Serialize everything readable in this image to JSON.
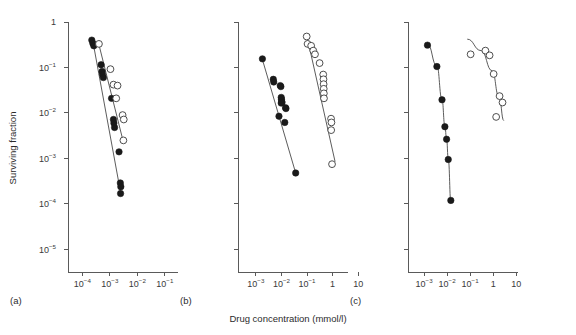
{
  "figure": {
    "width": 576,
    "height": 335,
    "background": "#ffffff",
    "xlabel": "Drug concentration (mmol/l)",
    "ylabel": "Surviving fraction",
    "line_color": "#4a4a4a",
    "axis_color": "#5a5a5a",
    "filled_marker_color": "#1a1a1a",
    "open_marker_color": "#ffffff"
  },
  "y_axis": {
    "label": "Surviving fraction",
    "type": "log",
    "ticks": [
      {
        "label": "1",
        "base": "1",
        "exp": "",
        "value": 1
      },
      {
        "label": "10-1",
        "base": "10",
        "exp": "−1",
        "value": 0.1
      },
      {
        "label": "10-2",
        "base": "10",
        "exp": "−2",
        "value": 0.01
      },
      {
        "label": "10-3",
        "base": "10",
        "exp": "−3",
        "value": 0.001
      },
      {
        "label": "10-4",
        "base": "10",
        "exp": "−4",
        "value": 0.0001
      },
      {
        "label": "10-5",
        "base": "10",
        "exp": "−5",
        "value": 1e-05
      }
    ],
    "range": [
      3.2e-06,
      1
    ]
  },
  "chart_data": [
    {
      "id": "panel-a",
      "type": "scatter",
      "panel_label": "(a)",
      "title": "",
      "xlabel": "Drug concentration (mmol/l)",
      "ylabel": "Surviving fraction",
      "xscale": "log",
      "yscale": "log",
      "xlim": [
        3e-05,
        0.3
      ],
      "ylim": [
        3.2e-06,
        1
      ],
      "grid": false,
      "legend": "none",
      "xticks": [
        {
          "base": "10",
          "exp": "−4",
          "value": 0.0001
        },
        {
          "base": "10",
          "exp": "−3",
          "value": 0.001
        },
        {
          "base": "10",
          "exp": "−2",
          "value": 0.01
        },
        {
          "base": "10",
          "exp": "−1",
          "value": 0.1
        }
      ],
      "series": [
        {
          "name": "filled-circles",
          "marker": "filled-circle",
          "x": [
            0.00022,
            0.00024,
            0.00026,
            0.00048,
            0.00052,
            0.00054,
            0.00058,
            0.00115,
            0.00135,
            0.0014,
            0.00148,
            0.00215,
            0.0024,
            0.0025,
            0.00245
          ],
          "y": [
            0.4,
            0.34,
            0.3,
            0.115,
            0.082,
            0.07,
            0.06,
            0.021,
            0.0072,
            0.006,
            0.0048,
            0.0014,
            0.00029,
            0.00024,
            0.00017
          ],
          "fit_line": {
            "x": [
              0.00024,
              0.00245
            ],
            "y": [
              0.38,
              0.00018
            ]
          }
        },
        {
          "name": "open-circles",
          "marker": "open-circle",
          "x": [
            0.0004,
            0.00105,
            0.00135,
            0.0019,
            0.0017,
            0.0029,
            0.0032,
            0.0031
          ],
          "y": [
            0.33,
            0.092,
            0.042,
            0.04,
            0.021,
            0.009,
            0.0072,
            0.0025
          ],
          "fit_line": {
            "x": [
              0.00038,
              0.00315
            ],
            "y": [
              0.36,
              0.0022
            ]
          }
        }
      ]
    },
    {
      "id": "panel-b",
      "type": "scatter",
      "panel_label": "(b)",
      "title": "",
      "xlabel": "Drug concentration (mmol/l)",
      "ylabel": "Surviving fraction",
      "xscale": "log",
      "yscale": "log",
      "xlim": [
        0.0002,
        4
      ],
      "ylim": [
        3.2e-06,
        1
      ],
      "grid": false,
      "legend": "none",
      "xticks": [
        {
          "base": "10",
          "exp": "−3",
          "value": 0.001
        },
        {
          "base": "10",
          "exp": "−2",
          "value": 0.01
        },
        {
          "base": "10",
          "exp": "−1",
          "value": 0.1
        },
        {
          "base": "1",
          "exp": "",
          "value": 1
        },
        {
          "base": "10",
          "exp": "",
          "value": 10
        }
      ],
      "series": [
        {
          "name": "filled-circles",
          "marker": "filled-circle",
          "x": [
            0.0018,
            0.0048,
            0.005,
            0.009,
            0.0095,
            0.0098,
            0.01,
            0.0102,
            0.0105,
            0.0098,
            0.0145,
            0.015,
            0.008,
            0.0135,
            0.036
          ],
          "y": [
            0.155,
            0.055,
            0.048,
            0.04,
            0.038,
            0.022,
            0.02,
            0.018,
            0.017,
            0.0165,
            0.013,
            0.0125,
            0.0085,
            0.0062,
            0.00048
          ],
          "fit_line": {
            "x": [
              0.0018,
              0.036
            ],
            "y": [
              0.15,
              0.00048
            ]
          }
        },
        {
          "name": "open-circles",
          "marker": "open-circle",
          "x": [
            0.097,
            0.105,
            0.145,
            0.175,
            0.205,
            0.31,
            0.43,
            0.44,
            0.445,
            0.45,
            0.455,
            0.46,
            0.87,
            0.9,
            0.88,
            0.95
          ],
          "y": [
            0.48,
            0.33,
            0.3,
            0.235,
            0.195,
            0.125,
            0.07,
            0.055,
            0.043,
            0.034,
            0.027,
            0.021,
            0.0075,
            0.0062,
            0.0042,
            0.00075
          ],
          "fit_line": {
            "x": [
              0.098,
              1.25
            ],
            "y": [
              0.5,
              0.00085
            ]
          }
        }
      ]
    },
    {
      "id": "panel-c",
      "type": "scatter",
      "panel_label": "(c)",
      "title": "",
      "xlabel": "Drug concentration (mmol/l)",
      "ylabel": "Surviving fraction",
      "xscale": "log",
      "yscale": "log",
      "xlim": [
        0.0002,
        12
      ],
      "ylim": [
        3.2e-06,
        1
      ],
      "grid": false,
      "legend": "none",
      "xticks": [
        {
          "base": "10",
          "exp": "−3",
          "value": 0.001
        },
        {
          "base": "10",
          "exp": "−2",
          "value": 0.01
        },
        {
          "base": "10",
          "exp": "−1",
          "value": 0.1
        },
        {
          "base": "1",
          "exp": "",
          "value": 1
        },
        {
          "base": "10",
          "exp": "",
          "value": 10
        }
      ],
      "series": [
        {
          "name": "filled-circles",
          "marker": "filled-circle",
          "x": [
            0.0014,
            0.0036,
            0.006,
            0.008,
            0.0095,
            0.0112,
            0.0145
          ],
          "y": [
            0.31,
            0.105,
            0.0195,
            0.005,
            0.00265,
            0.00095,
            0.00012
          ],
          "fit_curve": {
            "x": [
              0.0014,
              0.0036,
              0.006,
              0.008,
              0.0095,
              0.0112,
              0.0148
            ],
            "y": [
              0.33,
              0.108,
              0.02,
              0.0052,
              0.0027,
              0.00098,
              0.0001
            ]
          }
        },
        {
          "name": "open-circles",
          "marker": "open-circle",
          "x": [
            0.105,
            0.46,
            0.7,
            1.05,
            1.9,
            2.55,
            1.35
          ],
          "y": [
            0.195,
            0.235,
            0.185,
            0.072,
            0.0235,
            0.017,
            0.0082
          ],
          "fit_curve": {
            "x": [
              0.075,
              0.3,
              0.9,
              1.8,
              2.9
            ],
            "y": [
              0.42,
              0.235,
              0.085,
              0.0225,
              0.0068
            ]
          }
        }
      ]
    }
  ]
}
